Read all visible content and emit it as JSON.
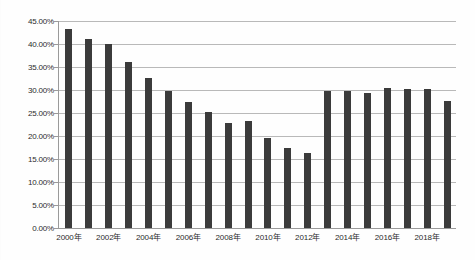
{
  "chart_data": {
    "type": "bar",
    "title": "",
    "subtitle": "",
    "xlabel": "",
    "ylabel": "",
    "categories": [
      "2000年",
      "2001年",
      "2002年",
      "2003年",
      "2004年",
      "2005年",
      "2006年",
      "2007年",
      "2008年",
      "2009年",
      "2010年",
      "2011年",
      "2012年",
      "2013年",
      "2014年",
      "2015年",
      "2016年",
      "2017年",
      "2018年",
      "2019年"
    ],
    "values": [
      43.3,
      41.1,
      40.0,
      36.1,
      32.6,
      29.8,
      27.4,
      25.2,
      22.8,
      23.3,
      19.6,
      17.4,
      16.3,
      29.8,
      29.8,
      29.3,
      30.5,
      30.2,
      30.2,
      27.6
    ],
    "value_unit": "%",
    "ylim": [
      0,
      45
    ],
    "ytick_step": 5,
    "ytick_labels": [
      "0.00%",
      "5.00%",
      "10.00%",
      "15.00%",
      "20.00%",
      "25.00%",
      "30.00%",
      "35.00%",
      "40.00%",
      "45.00%"
    ],
    "ytick_values": [
      0,
      5,
      10,
      15,
      20,
      25,
      30,
      35,
      40,
      45
    ],
    "xtick_labels": [
      "2000年",
      "2002年",
      "2004年",
      "2006年",
      "2008年",
      "2010年",
      "2012年",
      "2014年",
      "2016年",
      "2018年"
    ],
    "xtick_indices": [
      0,
      2,
      4,
      6,
      8,
      10,
      12,
      14,
      16,
      18
    ],
    "grid": true,
    "grid_axis": "y",
    "legend": false,
    "legend_position": "none",
    "series": [
      {
        "name": "",
        "values": [
          43.3,
          41.1,
          40.0,
          36.1,
          32.6,
          29.8,
          27.4,
          25.2,
          22.8,
          23.3,
          19.6,
          17.4,
          16.3,
          29.8,
          29.8,
          29.3,
          30.5,
          30.2,
          30.2,
          27.6
        ]
      }
    ]
  },
  "colors": {
    "bar": "#3b3b3b",
    "grid": "#b9b9b9",
    "axis": "#9a9a9a",
    "text": "#2b2b2b",
    "background": "#fefefe"
  }
}
